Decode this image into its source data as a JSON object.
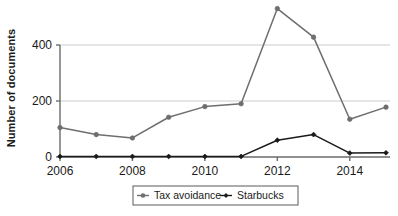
{
  "chart_data": {
    "type": "line",
    "title": "",
    "xlabel": "",
    "ylabel": "Number of documents",
    "x": [
      2006,
      2007,
      2008,
      2009,
      2010,
      2011,
      2012,
      2013,
      2014,
      2015
    ],
    "xticks": [
      "2006",
      "2008",
      "2010",
      "2012",
      "2014"
    ],
    "xtick_values": [
      2006,
      2008,
      2010,
      2012,
      2014
    ],
    "yticks": [
      "0",
      "200",
      "400"
    ],
    "ytick_values": [
      0,
      200,
      400
    ],
    "xlim": [
      2006,
      2015
    ],
    "ylim": [
      0,
      530
    ],
    "grid": "horizontal",
    "legend_position": "bottom",
    "series": [
      {
        "name": "Tax avoidance",
        "color": "#6e6e6e",
        "marker": "circle",
        "values": [
          105,
          80,
          68,
          142,
          180,
          190,
          530,
          428,
          135,
          178
        ]
      },
      {
        "name": "Starbucks",
        "color": "#1a1a1a",
        "marker": "diamond",
        "values": [
          2,
          2,
          2,
          2,
          2,
          2,
          60,
          80,
          14,
          15
        ]
      }
    ]
  },
  "legend": {
    "items": [
      {
        "label": "Tax avoidance",
        "color": "#6e6e6e"
      },
      {
        "label": "Starbucks",
        "color": "#1a1a1a"
      }
    ]
  },
  "axis": {
    "y_title": "Number of documents"
  },
  "colors": {
    "axis": "#6b6b6b",
    "grid": "#cccccc",
    "text": "#1a1a1a",
    "series_gray": "#6e6e6e",
    "series_black": "#1a1a1a",
    "background": "#ffffff"
  }
}
